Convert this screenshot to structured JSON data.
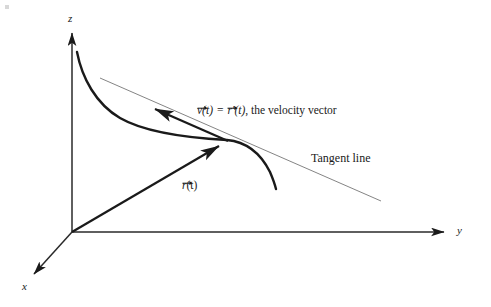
{
  "figure": {
    "background_color": "#ffffff",
    "ink_color": "#1a1a1a",
    "thin_line_color": "#6a6a6a"
  },
  "axes": {
    "z_label": "z",
    "y_label": "y",
    "x_label": "x",
    "origin": {
      "x": 72,
      "y": 232
    }
  },
  "labels": {
    "velocity": {
      "vector_symbol_v": "v",
      "arg_v": "(t)",
      "equals": "=",
      "vector_symbol_r": "r",
      "prime": "′",
      "arg_r": "(t)",
      "tail": ", the velocity vector",
      "full_text": "v(t) = r′(t), the velocity vector"
    },
    "position": {
      "vector_symbol_r": "r",
      "arg_r": "(t)",
      "full_text": "r(t)"
    },
    "tangent_line": "Tangent line"
  },
  "geometry": {
    "curve_start": {
      "x": 77,
      "y": 52
    },
    "tangent_point": {
      "x": 227,
      "y": 140
    },
    "curve_end": {
      "x": 276,
      "y": 189
    },
    "tangent_line_start": {
      "x": 100,
      "y": 78
    },
    "tangent_line_end": {
      "x": 381,
      "y": 201
    },
    "velocity_arrow_head": {
      "x": 152,
      "y": 104
    },
    "position_arrow_head": {
      "x": 222,
      "y": 142
    },
    "z_axis_top": {
      "x": 72,
      "y": 28
    },
    "y_axis_end": {
      "x": 449,
      "y": 232
    },
    "x_axis_end": {
      "x": 30,
      "y": 278
    }
  }
}
